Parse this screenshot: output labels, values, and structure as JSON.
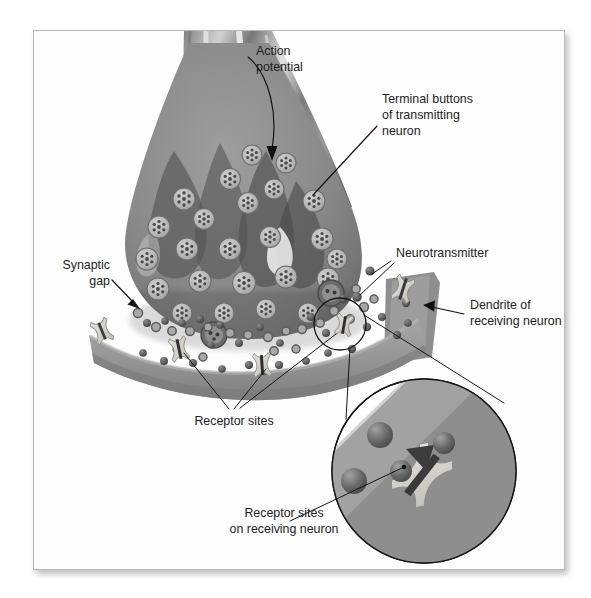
{
  "figure": {
    "background_color": "#ffffff",
    "frame_color": "#b9b9b9",
    "style": "grayscale textbook illustration"
  },
  "labels": {
    "action_potential": {
      "line1": "Action",
      "line2": "potential"
    },
    "terminal_buttons": {
      "line1": "Terminal buttons",
      "line2": "of transmitting",
      "line3": "neuron"
    },
    "neurotransmitter": {
      "line1": "Neurotransmitter"
    },
    "dendrite": {
      "line1": "Dendrite of",
      "line2": "receiving neuron"
    },
    "synaptic_gap": {
      "line1": "Synaptic",
      "line2": "gap"
    },
    "receptor_sites": {
      "line1": "Receptor sites"
    },
    "receptor_sites_inset": {
      "line1": "Receptor sites",
      "line2": "on receiving neuron"
    }
  },
  "colors": {
    "axon_dark": "#6e6e6e",
    "axon_mid": "#8c8c8c",
    "axon_light": "#c9c9c9",
    "terminal_fill": "#8a8a8a",
    "terminal_edge": "#5c5c5c",
    "vesicle_fill": "#b7b7b7",
    "vesicle_dot": "#4a4a4a",
    "dendrite_fill": "#9a9a9a",
    "dendrite_dark": "#7c7c7c",
    "receptor_fill": "#d4d2cb",
    "receptor_pocket": "#3a3a3a",
    "neurotransmitter": "#4e4e4e",
    "label_text": "#1d1d1d",
    "leader_line": "#121212"
  },
  "structures": {
    "axon": "axon of transmitting neuron entering from top-left",
    "terminal_button": "bulb-shaped axon terminal filled with synaptic vesicles",
    "vesicle_count": 34,
    "synaptic_gap": "cleft between terminal button and dendrite",
    "dendrite": "curved band of the receiving neuron running left to right",
    "receptor_count_main": 5,
    "magnifier": "circular inset magnifying one receptor site",
    "magnifier_receptors": 2,
    "magnifier_transmitters": 3
  }
}
